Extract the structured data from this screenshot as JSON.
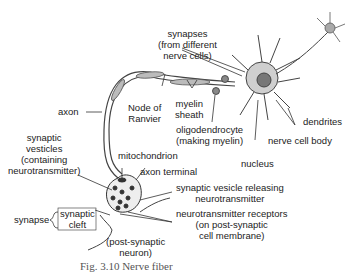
{
  "figure": {
    "caption": "Fig. 3.10 Nerve fiber",
    "labels": {
      "synapses": [
        "synapses",
        "(from different",
        "nerve cells)"
      ],
      "axon": "axon",
      "node_of_ranvier": [
        "Node of",
        "Ranvier"
      ],
      "myelin_sheath": [
        "myelin",
        "sheath"
      ],
      "oligodendrocyte": [
        "oligodendrocyte",
        "(making myelin)"
      ],
      "dendrites": "dendrites",
      "nerve_cell_body": "nerve cell body",
      "nucleus": "nucleus",
      "synaptic_vesicles": [
        "synaptic",
        "vesticles",
        "(containing",
        "neurotransmitter)"
      ],
      "mitochondrion": "mitochondrion",
      "axon_terminal": "axon terminal",
      "synaptic_vesicle_releasing": [
        "synaptic vesicle releasing",
        "neurotransmitter"
      ],
      "neurotransmitter_receptors": [
        "neurotransmitter receptors",
        "(on post-synaptic",
        "cell membrane)"
      ],
      "synapse": "synapse",
      "synaptic_cleft": [
        "synaptic",
        "cleft"
      ],
      "post_synaptic_neuron": [
        "(post-synaptic",
        "neuron)"
      ]
    },
    "colors": {
      "line": "#333333",
      "fill_dark": "#444444",
      "fill_light": "#d9d9d9",
      "background": "#ffffff"
    }
  }
}
